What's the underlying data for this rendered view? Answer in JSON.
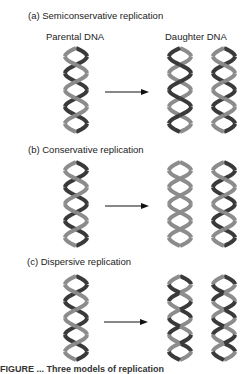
{
  "panels": [
    {
      "id": "a",
      "title": "(a)  Semiconservative replication",
      "parental_label": "Parental DNA",
      "daughter_label": "Daughter DNA",
      "parent": {
        "strands": [
          "dark",
          "light"
        ]
      },
      "daughters": [
        {
          "strands": [
            "light",
            "dark"
          ]
        },
        {
          "strands": [
            "dark",
            "light"
          ]
        }
      ]
    },
    {
      "id": "b",
      "title": "(b)  Conservative replication",
      "parent": {
        "strands": [
          "dark",
          "light"
        ]
      },
      "daughters": [
        {
          "strands": [
            "light",
            "light"
          ]
        },
        {
          "strands": [
            "dark",
            "light"
          ]
        }
      ]
    },
    {
      "id": "c",
      "title": "(c)  Dispersive replication",
      "parent": {
        "strands": [
          "dark",
          "light"
        ]
      },
      "daughters": [
        {
          "strands": [
            "mixed",
            "mixed"
          ]
        },
        {
          "strands": [
            "mixed",
            "mixed"
          ]
        }
      ]
    }
  ],
  "colors": {
    "dark": "#3a3a3a",
    "light": "#8c8c8c",
    "arrow": "#111111"
  },
  "caption": "FIGURE ...   Three models of replication"
}
